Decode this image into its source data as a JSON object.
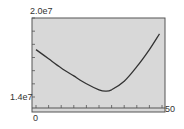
{
  "chart_data": {
    "type": "line",
    "title": "",
    "xlabel": "",
    "ylabel": "",
    "xlim": [
      0,
      50
    ],
    "ylim": [
      14000000,
      20000000
    ],
    "x_tick_labels": [
      "0",
      "50"
    ],
    "y_tick_labels": [
      "2.0e7",
      "1.4e7"
    ],
    "grid": false,
    "legend": null,
    "series": [
      {
        "name": "curve",
        "x": [
          0,
          5,
          10,
          15,
          20,
          25,
          27.5,
          30,
          35,
          40,
          45,
          49
        ],
        "values": [
          17600000,
          16900000,
          16200000,
          15600000,
          15000000,
          14550000,
          14450000,
          14550000,
          15200000,
          16300000,
          17600000,
          18800000
        ]
      }
    ],
    "colors": {
      "plot_background": "#d8d8d8",
      "frame": "#555555",
      "line": "#333333"
    }
  },
  "labels": {
    "y_top": "2.0e7",
    "y_bottom": "1.4e7",
    "x_left": "0",
    "x_right": "50"
  }
}
